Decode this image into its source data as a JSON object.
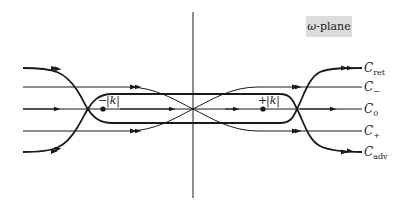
{
  "diagram": {
    "title_label": {
      "symbol": "ω",
      "text": "-plane"
    },
    "contours": [
      {
        "name": "C",
        "sub": "ret"
      },
      {
        "name": "C",
        "sub": "−"
      },
      {
        "name": "C",
        "sub": "0"
      },
      {
        "name": "C",
        "sub": "+"
      },
      {
        "name": "C",
        "sub": "adv"
      }
    ],
    "poles": [
      {
        "sign": "−",
        "label": "|k|"
      },
      {
        "sign": "+",
        "label": "|k|"
      }
    ],
    "colors": {
      "stroke": "#1a1a1a",
      "label_box": "#dcdcdc",
      "background": "#ffffff"
    }
  }
}
